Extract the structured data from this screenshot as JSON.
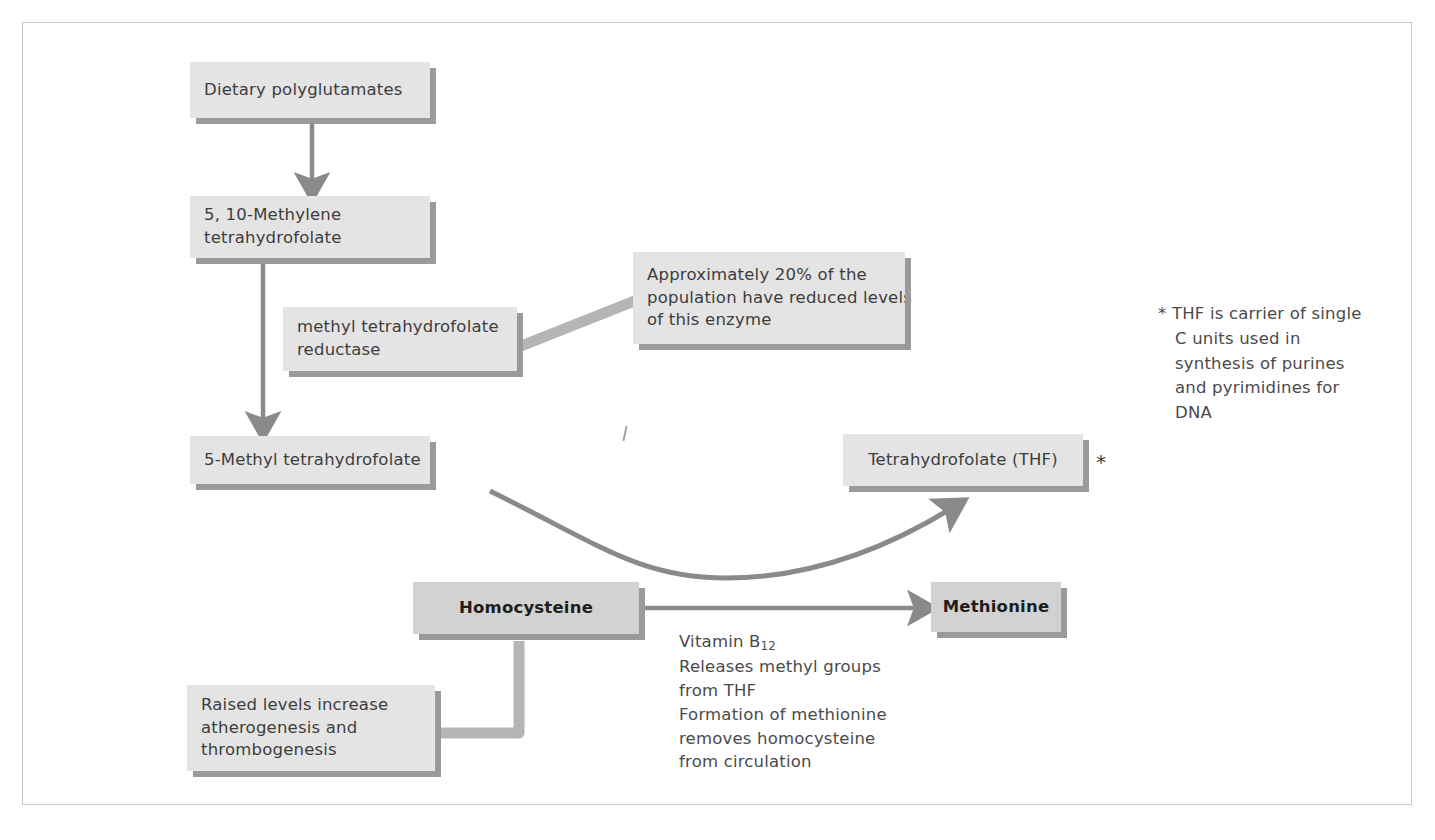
{
  "diagram": {
    "colors": {
      "box_fill": "#e4e4e4",
      "box_fill_strong": "#d2d2d2",
      "shadow": "#9a9a9a",
      "arrow": "#8a8a8a",
      "connector": "#b5b5b5",
      "text": "#3d3d3d",
      "frame": "#c9c9c9"
    },
    "boxes": {
      "dietary_polyglutamates": {
        "label": "Dietary polyglutamates"
      },
      "methylene_thf": {
        "line1": "5, 10-Methylene",
        "line2": "tetrahydrofolate"
      },
      "mthf_reductase": {
        "line1": "methyl tetrahydrofolate",
        "line2": "reductase"
      },
      "population_note": {
        "line1": "Approximately 20% of the",
        "line2": "population have reduced levels",
        "line3": "of this enzyme"
      },
      "methyl_thf": {
        "label": "5-Methyl tetrahydrofolate"
      },
      "thf": {
        "label": "Tetrahydrofolate (THF)"
      },
      "homocysteine": {
        "label": "Homocysteine"
      },
      "methionine": {
        "label": "Methionine"
      },
      "raised_levels": {
        "line1": "Raised levels increase",
        "line2": "atherogenesis and",
        "line3": "thrombogenesis"
      }
    },
    "annotations": {
      "thf_marker": "*",
      "thf_footnote": "* THF is carrier of single\nC units used in\nsynthesis of purines\nand pyrimidines for\nDNA",
      "vitamin_b12": {
        "prefix": "Vitamin B",
        "subscript": "12",
        "rest": "Releases methyl groups\nfrom THF\nFormation of methionine\nremoves homocysteine\nfrom circulation"
      }
    }
  }
}
